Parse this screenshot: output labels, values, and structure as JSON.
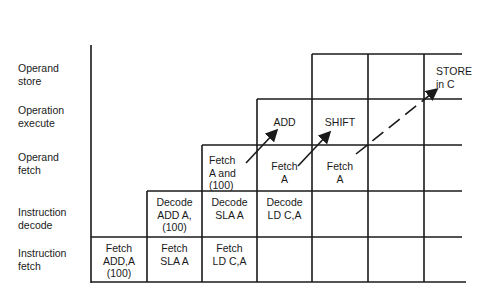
{
  "diagram": {
    "stages": [
      {
        "id": "operand-store",
        "label": "Operand\nstore"
      },
      {
        "id": "operation-execute",
        "label": "Operation\nexecute"
      },
      {
        "id": "operand-fetch",
        "label": "Operand\nfetch"
      },
      {
        "id": "instruction-decode",
        "label": "Instruction\ndecode"
      },
      {
        "id": "instruction-fetch",
        "label": "Instruction\nfetch"
      }
    ],
    "cells": {
      "fetch_add": "Fetch\nADD,A\n(100)",
      "fetch_sla": "Fetch\nSLA A",
      "fetch_ld": "Fetch\nLD C,A",
      "decode_add": "Decode\nADD A,\n(100)",
      "decode_sla": "Decode\nSLA A",
      "decode_ld": "Decode\nLD C,A",
      "opfetch_add": "Fetch\nA and\n(100)",
      "opfetch_sla": "Fetch\nA",
      "opfetch_ld": "Fetch\nA",
      "exec_add": "ADD",
      "exec_sla": "SHIFT",
      "store_ld": "STORE\nin C"
    },
    "colors": {
      "line": "#1a1a1a",
      "background": "#ffffff"
    }
  }
}
